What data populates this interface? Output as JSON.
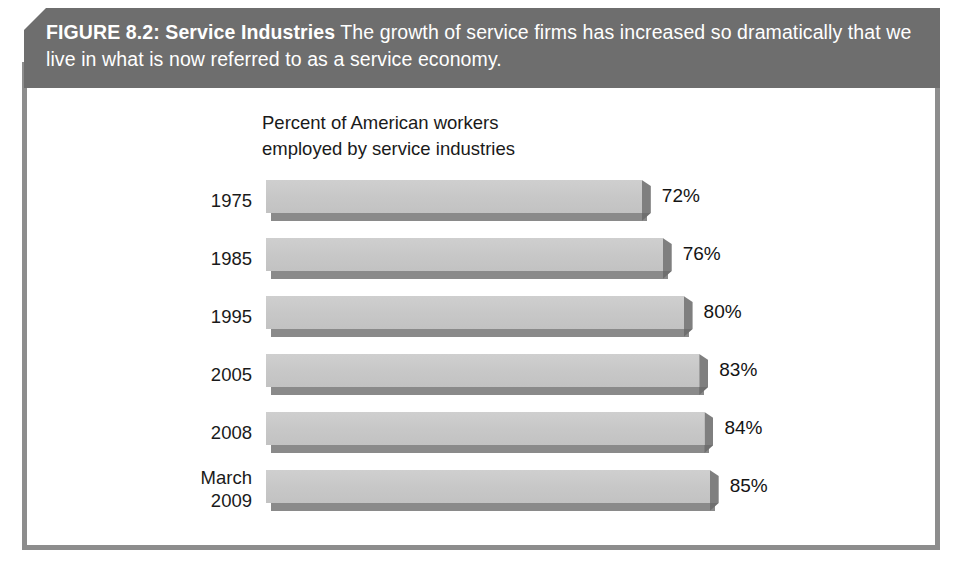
{
  "figure": {
    "title_bold": "FIGURE 8.2: Service Industries",
    "caption": " The growth of service firms has increased so dramatically that we live in what is now referred to as a service economy."
  },
  "chart_title_line1": "Percent of American workers",
  "chart_title_line2": "employed by service industries",
  "colors": {
    "banner_bg": "#6e6e6e",
    "frame_border": "#8d8d8d",
    "bar_face": "#c7c7c7",
    "bar_shadow": "#8a8a8a",
    "text": "#1a1a1a"
  },
  "chart_data": {
    "type": "bar",
    "orientation": "horizontal",
    "title": "Percent of American workers employed by service industries",
    "xlabel": "",
    "ylabel": "",
    "categories": [
      "1975",
      "1985",
      "1995",
      "2005",
      "2008",
      "March\n2009"
    ],
    "values": [
      72,
      76,
      80,
      83,
      84,
      85
    ],
    "value_labels": [
      "72%",
      "76%",
      "80%",
      "83%",
      "84%",
      "85%"
    ],
    "xlim": [
      0,
      100
    ],
    "grid": false,
    "legend": null,
    "bars": [
      {
        "category": "1975",
        "value": 72,
        "label": "72%"
      },
      {
        "category": "1985",
        "value": 76,
        "label": "76%"
      },
      {
        "category": "1995",
        "value": 80,
        "label": "80%"
      },
      {
        "category": "2005",
        "value": 83,
        "label": "83%"
      },
      {
        "category": "2008",
        "value": 84,
        "label": "84%"
      },
      {
        "category": "March\n2009",
        "value": 85,
        "label": "85%"
      }
    ]
  }
}
